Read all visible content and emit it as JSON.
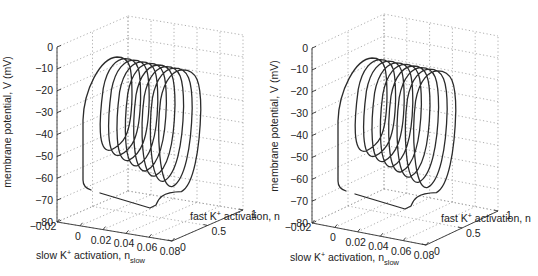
{
  "chart_data": [
    {
      "type": "line3d",
      "panel": "left",
      "title": "",
      "xlabel": "slow K+ activation, n_slow",
      "ylabel": "fast K+ activation, n",
      "zlabel": "membrane potential, V (mV)",
      "xlim": [
        -0.02,
        0.08
      ],
      "ylim": [
        0,
        1
      ],
      "zlim": [
        -80,
        0
      ],
      "xticks": [
        "-0.02",
        "0",
        "0.02",
        "0.04",
        "0.06",
        "0.08"
      ],
      "yticks": [
        "0",
        "0.5",
        "1"
      ],
      "zticks": [
        "0",
        "-10",
        "-20",
        "-30",
        "-40",
        "-50",
        "-60",
        "-70",
        "-80"
      ],
      "grid": true,
      "description": "Bursting trajectory: ~9 spike loops spiraling toward increasing n_slow, followed by a slow return along the bottom (V approx -65 to -72 mV)",
      "num_spike_loops": 9,
      "spike_peak_V": -8,
      "spike_trough_V_range": [
        -48,
        -62
      ],
      "quiescent_V_range": [
        -62,
        -72
      ],
      "n_slow_range_spanned": [
        0.0,
        0.06
      ]
    },
    {
      "type": "line3d",
      "panel": "right",
      "title": "",
      "xlabel": "slow K+ activation, n_slow",
      "ylabel": "fast K+ activation, n",
      "zlabel": "membrane potential, V (mV)",
      "xlim": [
        -0.02,
        0.08
      ],
      "ylim": [
        0,
        1
      ],
      "zlim": [
        -80,
        0
      ],
      "xticks": [
        "-0.02",
        "0",
        "0.02",
        "0.04",
        "0.06",
        "0.08"
      ],
      "yticks": [
        "0",
        "0.5",
        "1"
      ],
      "zticks": [
        "0",
        "-10",
        "-20",
        "-30",
        "-40",
        "-50",
        "-60",
        "-70",
        "-80"
      ],
      "grid": true,
      "description": "Near-identical bursting trajectory to left panel",
      "num_spike_loops": 9,
      "spike_peak_V": -8,
      "spike_trough_V_range": [
        -48,
        -62
      ],
      "quiescent_V_range": [
        -62,
        -72
      ],
      "n_slow_range_spanned": [
        0.0,
        0.06
      ]
    }
  ],
  "labels": {
    "zlabel": "membrane potential, V (mV)",
    "xlabel_main": "slow K",
    "xlabel_sup": "+",
    "xlabel_rest": " activation, n",
    "xlabel_sub": "slow",
    "ylabel_main": "fast K",
    "ylabel_sup": "+",
    "ylabel_rest": " activation, n"
  },
  "ticks": {
    "z": [
      "0",
      "−10",
      "−20",
      "−30",
      "−40",
      "−50",
      "−60",
      "−70",
      "−80"
    ],
    "x": [
      "−0.02",
      "0",
      "0.02",
      "0.04",
      "0.06",
      "0.08"
    ],
    "y": [
      "0",
      "0.5",
      "1"
    ]
  },
  "colors": {
    "trajectory": "#2b2b2b",
    "axis": "#333333",
    "grid": "#9a9a9a",
    "text": "#222222"
  }
}
